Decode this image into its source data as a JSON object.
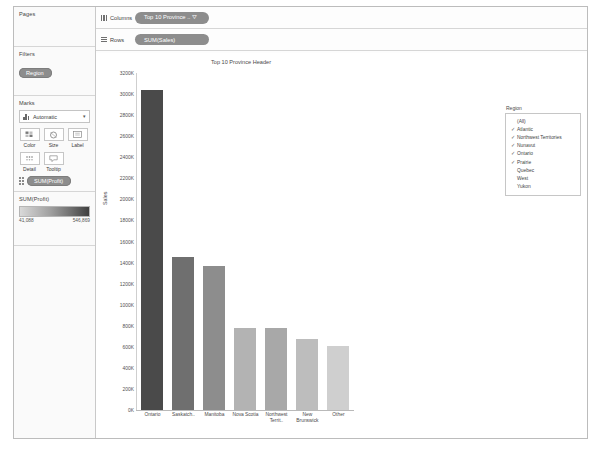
{
  "sidebar": {
    "pages": {
      "title": "Pages"
    },
    "filters": {
      "title": "Filters",
      "pills": [
        {
          "label": "Region"
        }
      ]
    },
    "marks": {
      "title": "Marks",
      "mark_type": "Automatic",
      "dropdown_caret": "▾",
      "buttons": [
        {
          "label": "Color",
          "icon": "color-palette-icon"
        },
        {
          "label": "Size",
          "icon": "size-circle-icon"
        },
        {
          "label": "Label",
          "icon": "label-text-icon"
        },
        {
          "label": "Detail",
          "icon": "detail-dots-icon"
        },
        {
          "label": "Tooltip",
          "icon": "tooltip-bubble-icon"
        }
      ],
      "measure_pill": "SUM(Profit)"
    },
    "color_legend": {
      "title": "SUM(Profit)",
      "min": "41,088",
      "max": "546,869"
    }
  },
  "shelves": [
    {
      "name": "Columns",
      "icon": "columns-icon",
      "pill": "Top 10 Province .. ⛛"
    },
    {
      "name": "Rows",
      "icon": "rows-icon",
      "pill": "SUM(Sales)"
    }
  ],
  "legend": {
    "title": "Region",
    "items": [
      {
        "label": "(All)",
        "checked": false
      },
      {
        "label": "Atlantic",
        "checked": true
      },
      {
        "label": "Northwest Territories",
        "checked": true
      },
      {
        "label": "Nunavut",
        "checked": true
      },
      {
        "label": "Ontario",
        "checked": true
      },
      {
        "label": "Prairie",
        "checked": true
      },
      {
        "label": "Quebec",
        "checked": false
      },
      {
        "label": "West",
        "checked": false
      },
      {
        "label": "Yukon",
        "checked": false
      }
    ],
    "check_glyph": "✓"
  },
  "chart_data": {
    "type": "bar",
    "title": "Top 10 Province Header",
    "xlabel": "",
    "ylabel": "Sales",
    "ylim": [
      0,
      3200000
    ],
    "grid": false,
    "categories": [
      "Ontario",
      "Saskatch..",
      "Manitoba",
      "Nova Scotia",
      "Northwest Territ..",
      "New Brunswick",
      "Other"
    ],
    "values": [
      3040000,
      1450000,
      1370000,
      780000,
      775000,
      670000,
      610000
    ],
    "colors": [
      "#4a4a4a",
      "#6f6f6f",
      "#8d8d8d",
      "#b3b3b3",
      "#a8a8a8",
      "#bdbdbd",
      "#cfcfcf"
    ],
    "y_ticks": [
      "3200K",
      "3000K",
      "2800K",
      "2600K",
      "2400K",
      "2200K",
      "2000K",
      "1800K",
      "1600K",
      "1400K",
      "1200K",
      "1000K",
      "800K",
      "600K",
      "400K",
      "200K",
      "0K"
    ],
    "y_tick_values": [
      3200000,
      3000000,
      2800000,
      2600000,
      2400000,
      2200000,
      2000000,
      1800000,
      1600000,
      1400000,
      1200000,
      1000000,
      800000,
      600000,
      400000,
      200000,
      0
    ]
  }
}
